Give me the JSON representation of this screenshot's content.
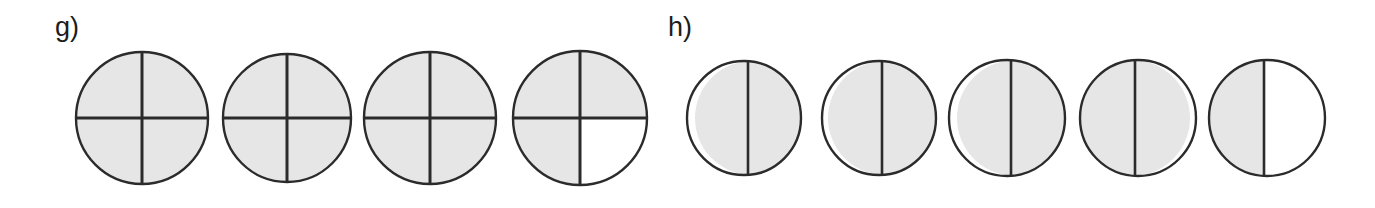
{
  "figure": {
    "background_color": "#ffffff",
    "fill_color": "#e6e6e6",
    "stroke_color": "#2b2b2b",
    "empty_color": "#ffffff",
    "panels": [
      {
        "label": "g)",
        "label_x": 55,
        "label_y": 14,
        "kind": "quartered-circles",
        "circles": [
          {
            "name": "g-circle-1",
            "cx": 142,
            "cy": 118,
            "r": 66,
            "divider_x": 142,
            "divider_y": 118,
            "quadrants": {
              "top_left": "filled",
              "top_right": "filled",
              "bottom_left": "filled",
              "bottom_right": "filled"
            },
            "filled_quarters": 4,
            "total_quarters": 4,
            "fraction": "4/4"
          },
          {
            "name": "g-circle-2",
            "cx": 287,
            "cy": 118,
            "r": 64,
            "divider_x": 287,
            "divider_y": 118,
            "quadrants": {
              "top_left": "filled",
              "top_right": "filled",
              "bottom_left": "filled",
              "bottom_right": "filled"
            },
            "filled_quarters": 4,
            "total_quarters": 4,
            "fraction": "4/4"
          },
          {
            "name": "g-circle-3",
            "cx": 430,
            "cy": 118,
            "r": 66,
            "divider_x": 430,
            "divider_y": 118,
            "quadrants": {
              "top_left": "filled",
              "top_right": "filled",
              "bottom_left": "filled",
              "bottom_right": "filled"
            },
            "filled_quarters": 4,
            "total_quarters": 4,
            "fraction": "4/4"
          },
          {
            "name": "g-circle-4",
            "cx": 580,
            "cy": 118,
            "r": 67,
            "divider_x": 580,
            "divider_y": 118,
            "quadrants": {
              "top_left": "filled",
              "top_right": "filled",
              "bottom_left": "filled",
              "bottom_right": "empty"
            },
            "filled_quarters": 3,
            "total_quarters": 4,
            "fraction": "3/4"
          }
        ]
      },
      {
        "label": "h)",
        "label_x": 668,
        "label_y": 14,
        "kind": "halved-circles",
        "circles": [
          {
            "name": "h-circle-1",
            "cx": 744,
            "cy": 118,
            "r": 57,
            "divider_x": 748,
            "halves": {
              "left": "filled",
              "right": "filled"
            },
            "filled_halves": 2,
            "total_halves": 2,
            "fraction": "2/2"
          },
          {
            "name": "h-circle-2",
            "cx": 879,
            "cy": 118,
            "r": 57,
            "divider_x": 882,
            "halves": {
              "left": "filled",
              "right": "filled"
            },
            "filled_halves": 2,
            "total_halves": 2,
            "fraction": "2/2"
          },
          {
            "name": "h-circle-3",
            "cx": 1007,
            "cy": 118,
            "r": 58,
            "divider_x": 1011,
            "halves": {
              "left": "filled",
              "right": "filled"
            },
            "filled_halves": 2,
            "total_halves": 2,
            "fraction": "2/2"
          },
          {
            "name": "h-circle-4",
            "cx": 1138,
            "cy": 118,
            "r": 58,
            "divider_x": 1135,
            "halves": {
              "left": "filled",
              "right": "filled"
            },
            "filled_halves": 2,
            "total_halves": 2,
            "fraction": "2/2"
          },
          {
            "name": "h-circle-5",
            "cx": 1267,
            "cy": 118,
            "r": 58,
            "divider_x": 1264,
            "halves": {
              "left": "filled",
              "right": "empty"
            },
            "filled_halves": 1,
            "total_halves": 2,
            "fraction": "1/2"
          }
        ]
      }
    ]
  }
}
